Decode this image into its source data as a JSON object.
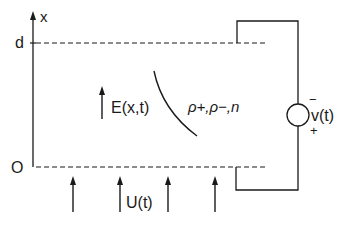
{
  "diagram": {
    "axis": {
      "label": "x",
      "top_label": "d",
      "bottom_label": "O"
    },
    "field": {
      "label": "E(x,t)"
    },
    "densities": {
      "label": "ρ+,ρ−,n"
    },
    "source": {
      "label": "v(t)",
      "minus": "−",
      "plus": "+"
    },
    "excitation": {
      "label": "U(t)"
    },
    "colors": {
      "stroke": "#1a1a1a",
      "background": "#ffffff"
    }
  }
}
